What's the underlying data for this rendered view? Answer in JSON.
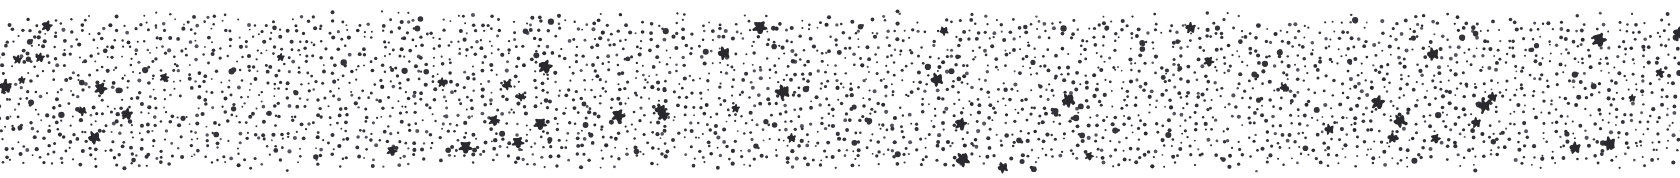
{
  "image": {
    "kind": "stipple-texture-band",
    "description": "Dense random stipple / halftone dot texture filling a wide horizontal band on white",
    "width": 1680,
    "height": 178,
    "background_color": "#ffffff"
  },
  "texture": {
    "dot_color": "#333338",
    "dot_color_dark": "#2a2a2e",
    "dot_color_light": "#55555c",
    "background_color": "#ffffff",
    "fill_region": {
      "left": 0,
      "right": 1680,
      "top": 10,
      "bottom": 172
    },
    "margins": {
      "top": 10,
      "bottom": 6,
      "left": 0,
      "right": 0
    },
    "small_dot": {
      "count": 6200,
      "min_radius": 0.9,
      "max_radius": 2.1,
      "jitter": 3.4,
      "grid_spacing": 8.4
    },
    "large_blob": {
      "count": 58,
      "min_radius": 3.0,
      "max_radius": 6.2,
      "lobes": 5,
      "lobe_wobble": 0.45
    },
    "medium_blob": {
      "count": 150,
      "min_radius": 2.0,
      "max_radius": 3.2
    },
    "edge_fade": {
      "top_band": 16,
      "bottom_band": 14
    },
    "random_seed": 20240917
  }
}
